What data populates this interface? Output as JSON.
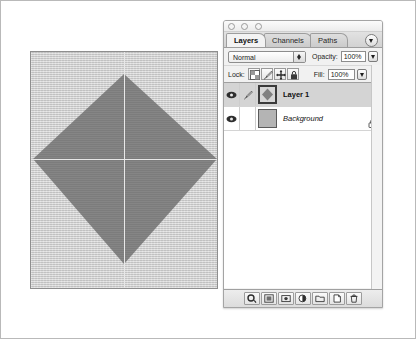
{
  "app": {
    "name": "Adobe Photoshop",
    "canvas": {
      "shape_name": "diamond",
      "shape_fill": "#808080",
      "background_fill": "#d2d2d2",
      "guide_color": "#e8e8e8",
      "guides": [
        "vertical",
        "horizontal"
      ]
    }
  },
  "palette": {
    "window_controls": [
      "close",
      "minimize",
      "zoom"
    ],
    "menu_button_icon": "panel-menu-icon",
    "tabs": [
      {
        "label": "Layers",
        "active": true
      },
      {
        "label": "Channels",
        "active": false
      },
      {
        "label": "Paths",
        "active": false
      }
    ],
    "blend": {
      "mode_value": "Normal",
      "opacity_label": "Opacity:",
      "opacity_value": "100%"
    },
    "lock": {
      "label": "Lock:",
      "buttons": [
        {
          "name": "lock-transparent-pixels",
          "icon": "checkerboard-icon"
        },
        {
          "name": "lock-image-pixels",
          "icon": "brush-icon"
        },
        {
          "name": "lock-position",
          "icon": "move-icon"
        },
        {
          "name": "lock-all",
          "icon": "padlock-icon"
        }
      ],
      "fill_label": "Fill:",
      "fill_value": "100%"
    },
    "layers": [
      {
        "name": "Layer 1",
        "visible": true,
        "selected": true,
        "style": "bold",
        "thumbnail": "diamond-thumbnail",
        "has_brush_indicator": true,
        "locked": false
      },
      {
        "name": "Background",
        "visible": true,
        "selected": false,
        "style": "italic",
        "thumbnail": "solid-gray-thumbnail",
        "has_brush_indicator": false,
        "locked": true
      }
    ],
    "bottom_tools": [
      {
        "name": "link-layers-button",
        "icon": "link-icon"
      },
      {
        "name": "layer-style-button",
        "icon": "fx-icon"
      },
      {
        "name": "add-layer-mask-button",
        "icon": "mask-icon"
      },
      {
        "name": "new-adjustment-layer-button",
        "icon": "half-circle-icon"
      },
      {
        "name": "new-group-button",
        "icon": "folder-icon"
      },
      {
        "name": "new-layer-button",
        "icon": "new-page-icon"
      },
      {
        "name": "delete-layer-button",
        "icon": "trash-icon"
      }
    ]
  }
}
